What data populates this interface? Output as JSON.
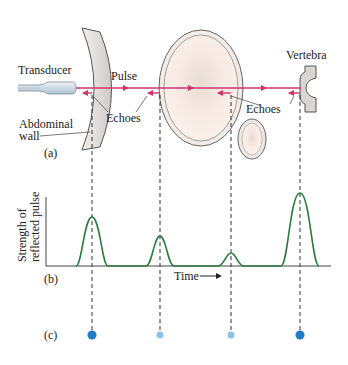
{
  "panel_a": {
    "tag": "(a)",
    "labels": {
      "transducer": "Transducer",
      "pulse": "Pulse",
      "echoes_left": "Echoes",
      "echoes_right": "Echoes",
      "vertebra": "Vertebra",
      "abdominal_line1": "Abdominal",
      "abdominal_line2": "wall"
    }
  },
  "panel_b": {
    "tag": "(b)",
    "ylabel_line1": "Strength of",
    "ylabel_line2": "reflected pulse",
    "xlabel": "Time"
  },
  "panel_c": {
    "tag": "(c)"
  },
  "colors": {
    "pulse": "#d2336a",
    "curve": "#2e7a3e",
    "dot_strong": "#1f7bc4",
    "dot_weak": "#8cc3e6",
    "tissue_fill": "#f8ece4",
    "wall_fill": "#dedad8"
  },
  "echo_positions": [
    {
      "name": "abdominal wall",
      "x": 92,
      "peak_strength": "high",
      "dot": "strong"
    },
    {
      "name": "organ front",
      "x": 160,
      "peak_strength": "medium",
      "dot": "weak"
    },
    {
      "name": "organ back",
      "x": 231,
      "peak_strength": "low",
      "dot": "weak"
    },
    {
      "name": "vertebra",
      "x": 300,
      "peak_strength": "highest",
      "dot": "strong"
    }
  ]
}
